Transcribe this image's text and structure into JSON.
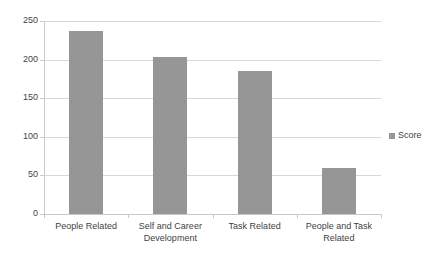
{
  "chart_data": {
    "type": "bar",
    "title": "",
    "subtitle": "",
    "xlabel": "",
    "ylabel": "",
    "categories": [
      "People Related",
      "Self and Career Development",
      "Task Related",
      "People and Task Related"
    ],
    "series": [
      {
        "name": "Score",
        "color": "#969696",
        "values": [
          237,
          204,
          185,
          60
        ]
      }
    ],
    "ylim": [
      0,
      250
    ],
    "ytick_labels": [
      "0",
      "50",
      "100",
      "150",
      "200",
      "250"
    ],
    "ytick_values": [
      0,
      50,
      100,
      150,
      200,
      250
    ],
    "grid": "horizontal",
    "legend": {
      "position": "right",
      "entries": [
        {
          "label": "Score",
          "color": "#969696"
        }
      ]
    },
    "colors": {
      "bar": "#969696",
      "gridline": "#d7d7d7",
      "axis": "#c9c9c9",
      "text": "#3f3f3f",
      "background": "#ffffff"
    }
  }
}
